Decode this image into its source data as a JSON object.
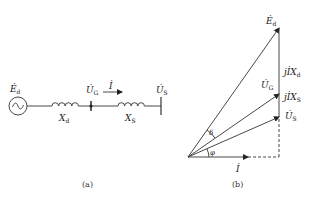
{
  "figure": {
    "panel_a": {
      "caption": "(a)",
      "source": {
        "symbol": "~",
        "label": "Ė",
        "label_sub": "d"
      },
      "inductor_d": {
        "label": "X",
        "label_sub": "d"
      },
      "node_g": {
        "label": "U̇",
        "label_sub": "G"
      },
      "current": {
        "label": "İ"
      },
      "inductor_s": {
        "label": "X",
        "label_sub": "S"
      },
      "bus_s": {
        "label": "U̇",
        "label_sub": "S"
      }
    },
    "panel_b": {
      "caption": "(b)",
      "phasor_ed": {
        "label": "Ė",
        "label_sub": "d"
      },
      "drop_xd": {
        "label": "jİX",
        "label_sub": "d"
      },
      "phasor_ug": {
        "label": "U̇",
        "label_sub": "G"
      },
      "drop_xs": {
        "label": "jİX",
        "label_sub": "S"
      },
      "phasor_us": {
        "label": "U̇",
        "label_sub": "S"
      },
      "angle_delta": {
        "label": "δ"
      },
      "angle_phi": {
        "label": "φ"
      },
      "phasor_i": {
        "label": "İ"
      }
    }
  }
}
